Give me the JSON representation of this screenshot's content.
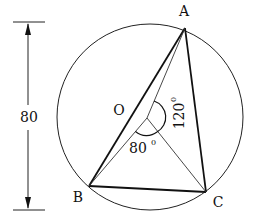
{
  "diagram": {
    "type": "circle-inscribed-triangle",
    "circle": {
      "cx": 150,
      "cy": 117,
      "r": 93
    },
    "points": {
      "A": {
        "x": 185,
        "y": 28,
        "label": "A"
      },
      "B": {
        "x": 89,
        "y": 186,
        "label": "B"
      },
      "C": {
        "x": 206,
        "y": 192,
        "label": "C"
      },
      "O": {
        "x": 147,
        "y": 118,
        "label": "O"
      }
    },
    "angles": {
      "BOC": {
        "value": "80",
        "unit": "0"
      },
      "AOC": {
        "value": "120",
        "unit": "0"
      }
    },
    "dimension": {
      "value": "80"
    }
  }
}
